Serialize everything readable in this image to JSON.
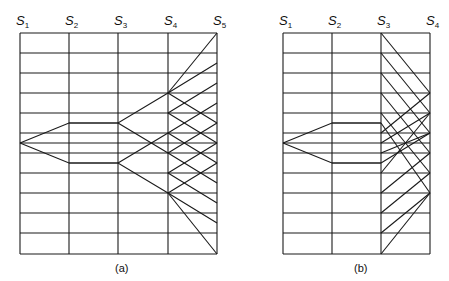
{
  "figure": {
    "diagrams": [
      {
        "id": "a",
        "caption": "(a)",
        "caption_pos": [
          115,
          272
        ],
        "stations": [
          {
            "main": "S",
            "sub": "1",
            "x": 20
          },
          {
            "main": "S",
            "sub": "2",
            "x": 69
          },
          {
            "main": "S",
            "sub": "3",
            "x": 118
          },
          {
            "main": "S",
            "sub": "4",
            "x": 168
          },
          {
            "main": "S",
            "sub": "5",
            "x": 217
          }
        ],
        "top": 33,
        "bottom": 254,
        "rows": [
          33,
          53,
          73,
          93,
          113,
          123,
          133,
          143,
          153,
          163,
          173,
          193,
          213,
          233,
          254
        ],
        "row_spans": [
          [
            20,
            217
          ],
          [
            20,
            217
          ],
          [
            20,
            217
          ],
          [
            20,
            217
          ],
          [
            20,
            217
          ],
          [
            69,
            118
          ],
          [
            20,
            217
          ],
          [
            20,
            217
          ],
          [
            20,
            217
          ],
          [
            69,
            118
          ],
          [
            20,
            217
          ],
          [
            20,
            217
          ],
          [
            20,
            217
          ],
          [
            20,
            217
          ],
          [
            20,
            217
          ]
        ],
        "paths": [
          [
            [
              20,
              143
            ],
            [
              69,
              123
            ],
            [
              118,
              123
            ],
            [
              168,
              93
            ],
            [
              217,
              63
            ]
          ],
          [
            [
              20,
              143
            ],
            [
              69,
              163
            ],
            [
              118,
              163
            ],
            [
              168,
              193
            ],
            [
              217,
              223
            ]
          ],
          [
            [
              118,
              123
            ],
            [
              168,
              153
            ],
            [
              217,
              183
            ]
          ],
          [
            [
              118,
              163
            ],
            [
              168,
              133
            ],
            [
              217,
              103
            ]
          ],
          [
            [
              168,
              93
            ],
            [
              217,
              123
            ]
          ],
          [
            [
              168,
              113
            ],
            [
              217,
              83
            ]
          ],
          [
            [
              168,
              113
            ],
            [
              217,
              143
            ]
          ],
          [
            [
              168,
              133
            ],
            [
              217,
              163
            ]
          ],
          [
            [
              168,
              153
            ],
            [
              217,
              123
            ]
          ],
          [
            [
              168,
              173
            ],
            [
              217,
              143
            ]
          ],
          [
            [
              168,
              173
            ],
            [
              217,
              203
            ]
          ],
          [
            [
              168,
              193
            ],
            [
              217,
              163
            ]
          ],
          [
            [
              168,
              93
            ],
            [
              217,
              33
            ]
          ],
          [
            [
              168,
              193
            ],
            [
              217,
              254
            ]
          ]
        ]
      },
      {
        "id": "b",
        "caption": "(b)",
        "caption_pos": [
          354,
          272
        ],
        "stations": [
          {
            "main": "S",
            "sub": "1",
            "x": 283
          },
          {
            "main": "S",
            "sub": "2",
            "x": 332
          },
          {
            "main": "S",
            "sub": "3",
            "x": 381
          },
          {
            "main": "S",
            "sub": "4",
            "x": 430
          }
        ],
        "top": 33,
        "bottom": 254,
        "rows": [
          33,
          53,
          73,
          93,
          113,
          123,
          133,
          143,
          153,
          163,
          173,
          193,
          213,
          233,
          254
        ],
        "row_spans": [
          [
            283,
            430
          ],
          [
            283,
            430
          ],
          [
            283,
            430
          ],
          [
            283,
            430
          ],
          [
            283,
            430
          ],
          [
            332,
            381
          ],
          [
            283,
            430
          ],
          [
            283,
            430
          ],
          [
            283,
            430
          ],
          [
            332,
            381
          ],
          [
            283,
            430
          ],
          [
            283,
            430
          ],
          [
            283,
            430
          ],
          [
            283,
            430
          ],
          [
            283,
            430
          ]
        ],
        "paths": [
          [
            [
              283,
              143
            ],
            [
              332,
              123
            ],
            [
              381,
              123
            ]
          ],
          [
            [
              283,
              143
            ],
            [
              332,
              163
            ],
            [
              381,
              163
            ]
          ],
          [
            [
              381,
              33
            ],
            [
              430,
              93
            ]
          ],
          [
            [
              381,
              53
            ],
            [
              430,
              113
            ]
          ],
          [
            [
              381,
              73
            ],
            [
              430,
              133
            ]
          ],
          [
            [
              381,
              93
            ],
            [
              430,
              153
            ]
          ],
          [
            [
              381,
              113
            ],
            [
              430,
              173
            ]
          ],
          [
            [
              381,
              123
            ],
            [
              430,
              193
            ]
          ],
          [
            [
              381,
              133
            ],
            [
              430,
              93
            ]
          ],
          [
            [
              381,
              143
            ],
            [
              430,
              113
            ]
          ],
          [
            [
              381,
              153
            ],
            [
              430,
              133
            ]
          ],
          [
            [
              381,
              163
            ],
            [
              430,
              133
            ]
          ],
          [
            [
              381,
              173
            ],
            [
              430,
              113
            ]
          ],
          [
            [
              381,
              193
            ],
            [
              430,
              153
            ]
          ],
          [
            [
              381,
              213
            ],
            [
              430,
              173
            ]
          ],
          [
            [
              381,
              233
            ],
            [
              430,
              193
            ]
          ],
          [
            [
              381,
              254
            ],
            [
              430,
              193
            ]
          ]
        ]
      }
    ]
  }
}
